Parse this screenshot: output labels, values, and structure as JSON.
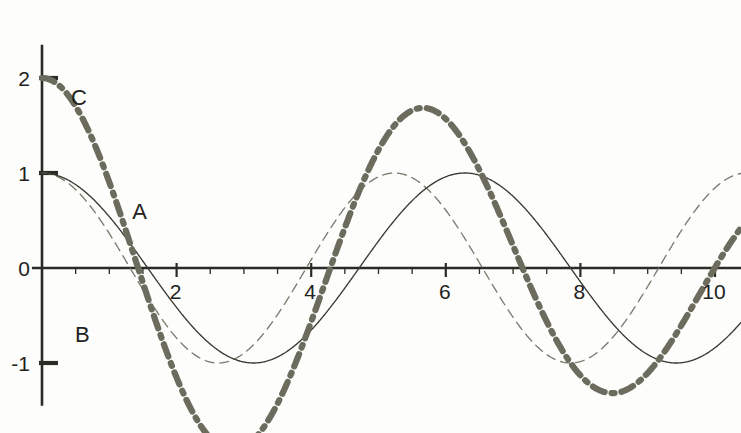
{
  "chart_data": {
    "type": "line",
    "title": "",
    "xlabel": "",
    "ylabel": "",
    "xlim": [
      -0.15,
      10.4
    ],
    "ylim": [
      -1.45,
      2.35
    ],
    "grid": false,
    "legend_position": "inline-annotations",
    "x_ticks_major": [
      2,
      4,
      6,
      8,
      10
    ],
    "x_tick_labels": [
      "2",
      "4",
      "6",
      "8",
      "10"
    ],
    "x_ticks_minor_step": 0.5,
    "y_ticks_major": [
      -1,
      0,
      1,
      2
    ],
    "y_tick_labels": [
      "-1",
      "0",
      "1",
      "2"
    ],
    "series": [
      {
        "name": "A",
        "label": "A",
        "style": "solid-thin",
        "color": "#3b3b33",
        "formula": "cos(x)",
        "amplitude": 1.0,
        "angular_frequency": 1.0,
        "phase": 0.0,
        "label_x": 1.45,
        "label_y": 0.52,
        "key_points": [
          {
            "x": 0,
            "y": 1.0
          },
          {
            "x": 1.57,
            "y": 0.0
          },
          {
            "x": 3.14,
            "y": -1.0
          },
          {
            "x": 4.71,
            "y": 0.0
          },
          {
            "x": 6.28,
            "y": 1.0
          },
          {
            "x": 7.85,
            "y": 0.0
          },
          {
            "x": 9.42,
            "y": -1.0
          },
          {
            "x": 10.4,
            "y": -0.55
          }
        ]
      },
      {
        "name": "B",
        "label": "B",
        "style": "dashed-thin",
        "color": "#7b7b6e",
        "formula": "cos(1.2x)",
        "amplitude": 1.0,
        "angular_frequency": 1.2,
        "phase": 0.0,
        "label_x": 0.6,
        "label_y": -0.78,
        "key_points": [
          {
            "x": 0,
            "y": 1.0
          },
          {
            "x": 1.31,
            "y": 0.0
          },
          {
            "x": 2.62,
            "y": -1.0
          },
          {
            "x": 3.93,
            "y": 0.0
          },
          {
            "x": 5.24,
            "y": 1.0
          },
          {
            "x": 6.54,
            "y": 0.0
          },
          {
            "x": 7.85,
            "y": -1.0
          },
          {
            "x": 9.16,
            "y": 0.0
          },
          {
            "x": 10.4,
            "y": 0.93
          }
        ]
      },
      {
        "name": "C",
        "label": "C",
        "style": "dash-dot-thick",
        "color": "#6c6c5e",
        "formula": "cos(x) + cos(1.2x)",
        "amplitude": 2.0,
        "label_x": 0.55,
        "label_y": 1.72,
        "key_points": [
          {
            "x": 0,
            "y": 2.0
          },
          {
            "x": 1.43,
            "y": 0.0
          },
          {
            "x": 1.7,
            "y": -1.15
          },
          {
            "x": 3.0,
            "y": 0.0
          },
          {
            "x": 4.7,
            "y": -1.18
          },
          {
            "x": 6.28,
            "y": 2.0
          },
          {
            "x": 7.9,
            "y": -1.18
          },
          {
            "x": 9.4,
            "y": 0.0
          },
          {
            "x": 10.4,
            "y": -0.66
          }
        ]
      }
    ],
    "annotations": [
      {
        "text": "A",
        "x": 1.45,
        "y": 0.52
      },
      {
        "text": "B",
        "x": 0.6,
        "y": -0.78
      },
      {
        "text": "C",
        "x": 0.55,
        "y": 1.72
      }
    ],
    "axes": {
      "x_axis_y_value": 0,
      "y_axis_x_value": 0,
      "x_axis_extent": [
        -0.15,
        10.4
      ],
      "y_axis_extent": [
        -1.45,
        2.35
      ]
    }
  }
}
